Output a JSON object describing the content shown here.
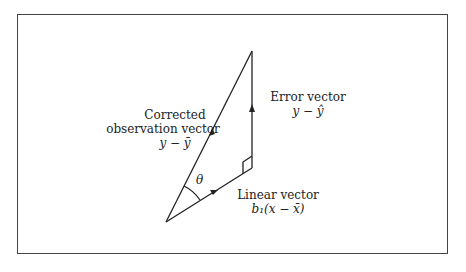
{
  "diagram": {
    "vectors": [
      {
        "name": "corrected-observation-vector",
        "label": "Corrected",
        "label2": "observation vector",
        "expr": "y − ȳ"
      },
      {
        "name": "error-vector",
        "label": "Error vector",
        "expr": "y − ŷ"
      },
      {
        "name": "linear-vector",
        "label": "Linear vector",
        "expr": "b₁(x − x̄)"
      }
    ],
    "angle_label": "θ"
  }
}
